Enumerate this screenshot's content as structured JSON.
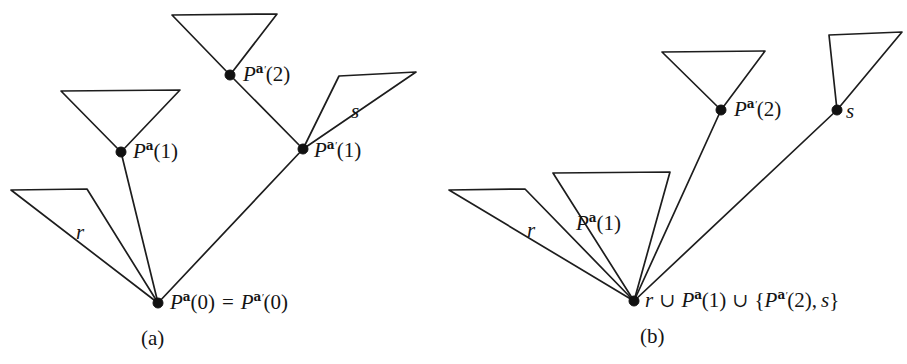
{
  "figure": {
    "background_color": "#ffffff",
    "line_color": "#1d1d1d",
    "node_color": "#111111",
    "width": 907,
    "height": 364
  },
  "panel_a": {
    "caption": "(a)",
    "nodes": [
      {
        "name": "root",
        "label_root": "P",
        "sup": "a",
        "prime": false,
        "arg": "(0)",
        "x": 158,
        "y": 303
      },
      {
        "name": "pa1",
        "label_root": "P",
        "sup": "a",
        "prime": false,
        "arg": "(1)",
        "x": 121,
        "y": 152
      },
      {
        "name": "pap1",
        "label_root": "P",
        "sup": "a",
        "prime": true,
        "arg": "(1)",
        "x": 303,
        "y": 149
      },
      {
        "name": "pap2",
        "label_root": "P",
        "sup": "a",
        "prime": true,
        "arg": "(2)",
        "x": 230,
        "y": 75
      }
    ],
    "labels": {
      "root_equation_left": "P",
      "root_equation_eq": "=",
      "pa1_text": "P",
      "r_label": "r",
      "s_label": "s"
    },
    "tri_r": {
      "tl_x": 11,
      "tl_y": 190,
      "tr_x": 87,
      "tr_y": 189
    },
    "tri_pa1": {
      "tl_x": 61,
      "tl_y": 91,
      "tr_x": 180,
      "tr_y": 90
    },
    "tri_pap2": {
      "tl_x": 172,
      "tl_y": 15,
      "tr_x": 277,
      "tr_y": 14
    },
    "tri_s": {
      "tl_x": 339,
      "tl_y": 76,
      "tr_x": 416,
      "tr_y": 72
    }
  },
  "panel_b": {
    "caption": "(b)",
    "nodes": [
      {
        "name": "root",
        "x": 634,
        "y": 301
      },
      {
        "name": "pap2",
        "label_root": "P",
        "sup": "a",
        "prime": true,
        "arg": "(2)",
        "x": 721,
        "y": 110
      },
      {
        "name": "s",
        "label_root": "s",
        "x": 837,
        "y": 110
      }
    ],
    "labels": {
      "r_label": "r",
      "pa1_label": "P",
      "s_label": "s",
      "union_symbol": "∪",
      "brace_open": "{",
      "brace_close": "}",
      "comma": ","
    },
    "tri_r": {
      "tl_x": 449,
      "tl_y": 190,
      "tr_x": 525,
      "tr_y": 189
    },
    "tri_pa1": {
      "tl_x": 553,
      "tl_y": 173,
      "tr_x": 670,
      "tr_y": 172
    },
    "tri_pap2": {
      "tl_x": 662,
      "tl_y": 52,
      "tr_x": 765,
      "tr_y": 51
    },
    "tri_s": {
      "tl_x": 829,
      "tl_y": 35,
      "tr_x": 902,
      "tr_y": 32
    }
  },
  "text": {
    "P": "P",
    "a": "a",
    "prime": "′",
    "zero": "(0)",
    "one": "(1)",
    "two": "(2)",
    "eq": "=",
    "r": "r",
    "s": "s",
    "union": "∪",
    "lbrace": "{",
    "rbrace": "}",
    "comma": ",",
    "caption_a": "(a)",
    "caption_b": "(b)"
  }
}
